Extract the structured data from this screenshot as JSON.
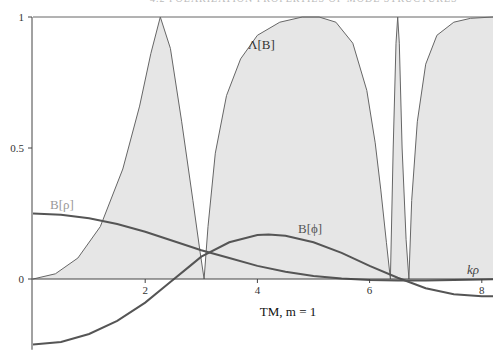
{
  "header": {
    "text": "4.2 POLARIZATION PROPERTIES OF MODE STRUCTURES"
  },
  "chart_data": {
    "type": "line",
    "title": "TM, m = 1",
    "xlabel": "kρ",
    "ylabel": "",
    "xlim": [
      0,
      8.2
    ],
    "ylim": [
      -0.27,
      1
    ],
    "xticks": [
      2,
      4,
      6,
      8
    ],
    "yticks": [
      0,
      0.5,
      1
    ],
    "ytick_labels": [
      "0",
      "0.5",
      "1"
    ],
    "xtick_labels": [
      "2",
      "4",
      "6",
      "8"
    ],
    "grid": false,
    "series": [
      {
        "name": "Λ[B]",
        "style": "filled",
        "x": [
          0,
          0.4,
          0.8,
          1.2,
          1.6,
          1.9,
          2.1,
          2.27,
          2.45,
          2.65,
          2.85,
          2.98,
          3.05,
          3.12,
          3.25,
          3.45,
          3.7,
          4.0,
          4.4,
          4.8,
          5.1,
          5.4,
          5.7,
          5.95,
          6.1,
          6.2,
          6.3,
          6.37,
          6.42,
          6.47,
          6.5,
          6.53,
          6.58,
          6.65,
          6.7,
          6.75,
          6.85,
          7.0,
          7.2,
          7.5,
          7.8,
          8.2
        ],
        "y": [
          0,
          0.02,
          0.08,
          0.2,
          0.42,
          0.66,
          0.86,
          1.0,
          0.88,
          0.6,
          0.3,
          0.1,
          0.0,
          0.2,
          0.48,
          0.7,
          0.84,
          0.93,
          0.98,
          1.0,
          1.0,
          0.98,
          0.9,
          0.72,
          0.52,
          0.34,
          0.14,
          0.0,
          0.5,
          0.9,
          1.0,
          0.9,
          0.5,
          0.15,
          0.0,
          0.3,
          0.6,
          0.82,
          0.93,
          0.98,
          0.995,
          1.0
        ]
      },
      {
        "name": "B[ρ]",
        "x": [
          0,
          0.5,
          1.0,
          1.5,
          2.0,
          2.5,
          3.0,
          3.5,
          4.0,
          4.5,
          5.0,
          5.5,
          6.0,
          6.5,
          7.0,
          7.5,
          8.0,
          8.2
        ],
        "y": [
          0.25,
          0.245,
          0.232,
          0.21,
          0.18,
          0.145,
          0.11,
          0.08,
          0.05,
          0.028,
          0.012,
          0.002,
          -0.004,
          -0.006,
          -0.006,
          -0.004,
          -0.002,
          -0.001
        ]
      },
      {
        "name": "B[ϕ]",
        "x": [
          0,
          0.5,
          1.0,
          1.5,
          2.0,
          2.4,
          2.8,
          3.0,
          3.5,
          4.0,
          4.2,
          4.5,
          5.0,
          5.5,
          6.0,
          6.5,
          7.0,
          7.5,
          8.0,
          8.2
        ],
        "y": [
          -0.25,
          -0.24,
          -0.21,
          -0.16,
          -0.09,
          -0.02,
          0.05,
          0.085,
          0.14,
          0.168,
          0.17,
          0.165,
          0.14,
          0.1,
          0.05,
          0.005,
          -0.035,
          -0.058,
          -0.066,
          -0.066
        ]
      }
    ],
    "annotations": [
      {
        "text": "Λ[B]",
        "x": 4.3,
        "y": 0.9
      },
      {
        "text": "B[ρ]",
        "x": 0.3,
        "y": 0.28
      },
      {
        "text": "B[ϕ]",
        "x": 4.8,
        "y": 0.175
      },
      {
        "text": "kρ",
        "x": 7.95,
        "y": 0.03
      }
    ]
  },
  "labels": {
    "lambda": "Λ[B]",
    "b_rho": "B[ρ]",
    "b_phi": "B[ϕ]",
    "x_axis": "kρ",
    "caption": "TM, m = 1"
  },
  "colors": {
    "fill": "#e6e6e6",
    "lambda_line": "#666666",
    "b_rho_line": "#555555",
    "b_phi_line": "#555555",
    "axis": "#444444",
    "label_gray": "#999999"
  }
}
